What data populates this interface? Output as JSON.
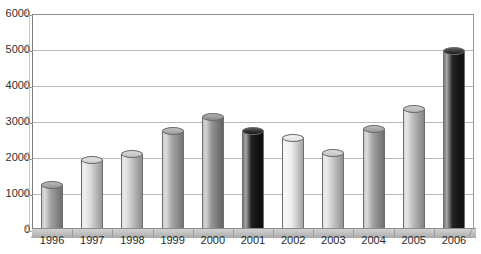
{
  "chart_data": {
    "type": "bar",
    "title": "",
    "subtitle": "",
    "xlabel": "",
    "ylabel": "",
    "categories": [
      "1996",
      "1997",
      "1998",
      "1999",
      "2000",
      "2001",
      "2002",
      "2003",
      "2004",
      "2005",
      "2006"
    ],
    "values": [
      1250,
      1950,
      2100,
      2750,
      3150,
      2750,
      2550,
      2150,
      2800,
      3350,
      4980
    ],
    "series": [
      {
        "name": "",
        "values": [
          1250,
          1950,
          2100,
          2750,
          3150,
          2750,
          2550,
          2150,
          2800,
          3350,
          4980
        ]
      }
    ],
    "ylim": [
      0,
      6000
    ],
    "ytick_labels": [
      "0",
      "1000",
      "2000",
      "3000",
      "4000",
      "5000",
      "6000"
    ],
    "ytick_values": [
      0,
      1000,
      2000,
      3000,
      4000,
      5000,
      6000
    ],
    "grid": true,
    "legend": "none",
    "legend_position": "none",
    "bar_style": "3d-cylinder",
    "bar_colors": [
      "#9e9e9e",
      "#d8d8d8",
      "#c9c9c9",
      "#a6a6a6",
      "#8f8f8f",
      "#141414",
      "#ececec",
      "#cfcfcf",
      "#a0a0a0",
      "#bcbcbc",
      "#1a1a1a"
    ],
    "annotations": []
  },
  "axes": {
    "y_ticks": [
      {
        "label": "6000",
        "value": 6000
      },
      {
        "label": "5000",
        "value": 5000
      },
      {
        "label": "4000",
        "value": 4000
      },
      {
        "label": "3000",
        "value": 3000
      },
      {
        "label": "2000",
        "value": 2000
      },
      {
        "label": "1000",
        "value": 1000
      },
      {
        "label": "0",
        "value": 0
      }
    ],
    "x_ticks": [
      {
        "label": "1996"
      },
      {
        "label": "1997"
      },
      {
        "label": "1998"
      },
      {
        "label": "1999"
      },
      {
        "label": "2000"
      },
      {
        "label": "2001"
      },
      {
        "label": "2002"
      },
      {
        "label": "2003"
      },
      {
        "label": "2004"
      },
      {
        "label": "2005"
      },
      {
        "label": "2006"
      }
    ]
  },
  "ghost_text": ""
}
